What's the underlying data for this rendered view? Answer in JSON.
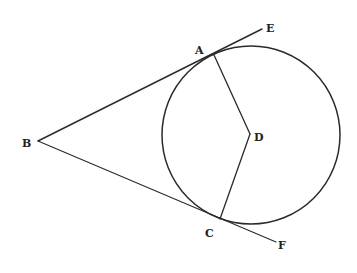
{
  "diagram": {
    "type": "geometry",
    "circle": {
      "center_label": "D",
      "cx": 251,
      "cy": 135,
      "r": 89
    },
    "points": {
      "A": {
        "label": "A",
        "x": 214,
        "y": 55,
        "label_x": 195,
        "label_y": 54
      },
      "B": {
        "label": "B",
        "x": 38,
        "y": 141,
        "label_x": 22,
        "label_y": 147
      },
      "C": {
        "label": "C",
        "x": 220,
        "y": 219,
        "label_x": 205,
        "label_y": 237
      },
      "D": {
        "label": "D",
        "x": 250,
        "y": 134,
        "label_x": 254,
        "label_y": 141
      },
      "E": {
        "label": "E",
        "x": 262,
        "y": 29,
        "label_x": 266,
        "label_y": 32
      },
      "F": {
        "label": "F",
        "x": 276,
        "y": 242,
        "label_x": 278,
        "label_y": 249
      }
    },
    "segments": [
      {
        "from": "B",
        "to": "E",
        "name": "tangent-BAE"
      },
      {
        "from": "B",
        "to": "F",
        "name": "tangent-BCF"
      },
      {
        "from": "A",
        "to": "D",
        "name": "radius-DA"
      },
      {
        "from": "D",
        "to": "C",
        "name": "radius-DC"
      }
    ]
  }
}
